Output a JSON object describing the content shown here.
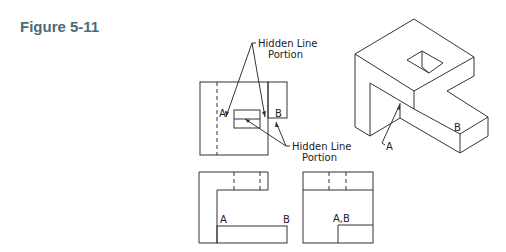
{
  "figure": {
    "title": "Figure 5-11"
  },
  "callouts": {
    "top": {
      "line1": "Hidden Line",
      "line2": "Portion"
    },
    "bottom": {
      "line1": "Hidden Line",
      "line2": "Portion"
    }
  },
  "labels": {
    "top_view_a": "A",
    "top_view_b": "B",
    "front_view_a": "A",
    "front_view_b": "B",
    "side_view_ab": "A,B",
    "iso_a": "A",
    "iso_b": "B"
  },
  "colors": {
    "title": "#4a6b78",
    "lines": "#333333"
  }
}
